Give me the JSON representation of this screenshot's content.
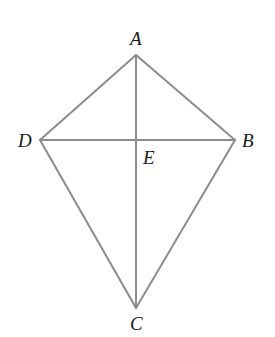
{
  "diagram": {
    "line_color": "#8c8c8c",
    "text_color": "#1a1a1a",
    "points": {
      "A": {
        "label": "A",
        "x": 136,
        "y": 55
      },
      "B": {
        "label": "B",
        "x": 235,
        "y": 140
      },
      "C": {
        "label": "C",
        "x": 136,
        "y": 308
      },
      "D": {
        "label": "D",
        "x": 40,
        "y": 140
      },
      "E": {
        "label": "E",
        "x": 136,
        "y": 140
      }
    },
    "segments": [
      [
        "A",
        "B"
      ],
      [
        "B",
        "C"
      ],
      [
        "C",
        "D"
      ],
      [
        "D",
        "A"
      ],
      [
        "A",
        "C"
      ],
      [
        "D",
        "B"
      ]
    ],
    "labels": {
      "A": "A",
      "B": "B",
      "C": "C",
      "D": "D",
      "E": "E"
    }
  }
}
